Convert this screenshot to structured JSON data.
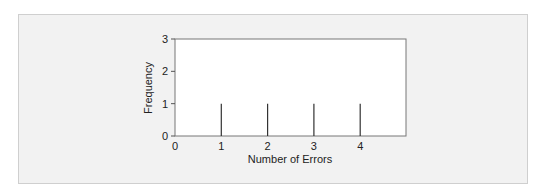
{
  "chart_data": {
    "type": "bar",
    "subtype": "spike",
    "title": "",
    "xlabel": "Number of Errors",
    "ylabel": "Frequency",
    "categories": [
      "1",
      "2",
      "3",
      "4"
    ],
    "x": [
      1,
      2,
      3,
      4
    ],
    "values": [
      1,
      1,
      1,
      1
    ],
    "xlim": [
      0,
      5
    ],
    "ylim": [
      0,
      3
    ],
    "xticks": [
      "0",
      "1",
      "2",
      "3",
      "4"
    ],
    "yticks": [
      "0",
      "1",
      "2",
      "3"
    ],
    "grid": false,
    "legend": null
  },
  "colors": {
    "panel_bg": "#f2f2f2",
    "plot_bg": "#ffffff",
    "axis": "#555555",
    "spike": "#333333"
  }
}
